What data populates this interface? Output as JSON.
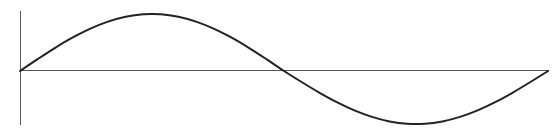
{
  "figure": {
    "background_color": "#ffffff",
    "width": 558,
    "height": 129
  },
  "axes": {
    "y_axis": {
      "label": "vertical-axis",
      "color": "#555555",
      "stroke_width": 1.1,
      "x": 20.5,
      "y_top": 11,
      "y_bottom": 125
    },
    "x_axis": {
      "label": "horizontal-axis",
      "color": "#555555",
      "stroke_width": 1.1,
      "y": 70.5,
      "x_left": 20,
      "x_right": 549
    },
    "origin": {
      "x": 20.5,
      "y": 70.5
    }
  },
  "curve": {
    "label": "sine-curve",
    "color": "#222222",
    "stroke_width": 2.0,
    "start": {
      "x": 20,
      "y": 71
    },
    "peak": {
      "x": 147,
      "y": 14
    },
    "zero_crossing": {
      "x": 285,
      "y": 71
    },
    "trough": {
      "x": 424,
      "y": 124
    },
    "end": {
      "x": 548,
      "y": 71
    }
  },
  "chart_data": {
    "type": "line",
    "title": "",
    "subtitle": "",
    "xlabel": "",
    "ylabel": "",
    "grid": false,
    "legend": null,
    "xlim": [
      0,
      6.283185
    ],
    "ylim": [
      -1.1,
      1.1
    ],
    "xticks": [],
    "yticks": [],
    "series": [
      {
        "name": "sin(x)",
        "x": [
          0.0,
          0.2094,
          0.4189,
          0.6283,
          0.8378,
          1.0472,
          1.2566,
          1.4661,
          1.6755,
          1.885,
          2.0944,
          2.3038,
          2.5133,
          2.7227,
          2.9322,
          3.1416,
          3.351,
          3.5605,
          3.7699,
          3.9794,
          4.1888,
          4.3982,
          4.6077,
          4.8171,
          5.0265,
          5.236,
          5.4454,
          5.6549,
          5.8643,
          6.0737,
          6.2832
        ],
        "y": [
          0.0,
          0.208,
          0.407,
          0.588,
          0.743,
          0.866,
          0.951,
          0.995,
          0.995,
          0.951,
          0.866,
          0.743,
          0.588,
          0.407,
          0.208,
          0.0,
          -0.208,
          -0.407,
          -0.588,
          -0.743,
          -0.866,
          -0.951,
          -0.995,
          -0.995,
          -0.951,
          -0.866,
          -0.743,
          -0.588,
          -0.407,
          -0.208,
          0.0
        ]
      }
    ],
    "annotations": []
  }
}
